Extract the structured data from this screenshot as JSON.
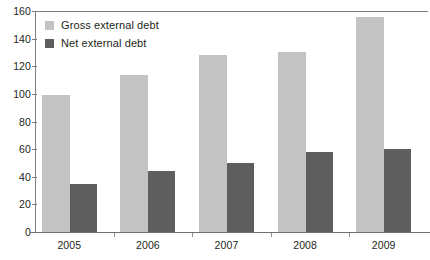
{
  "chart_data": {
    "type": "bar",
    "title": "",
    "subtitle": "",
    "xlabel": "",
    "ylabel": "",
    "categories": [
      "2005",
      "2006",
      "2007",
      "2008",
      "2009"
    ],
    "series": [
      {
        "name": "Gross external debt",
        "color": "#c3c3c3",
        "values": [
          99,
          114,
          128,
          130,
          156
        ]
      },
      {
        "name": "Net external debt",
        "color": "#5e5e5e",
        "values": [
          35,
          44,
          50,
          58,
          60
        ]
      }
    ],
    "ylim": [
      0,
      160
    ],
    "yticks": [
      0,
      20,
      40,
      60,
      80,
      100,
      120,
      140,
      160
    ],
    "ytick_labels": [
      "0",
      "20",
      "40",
      "60",
      "80",
      "100",
      "120",
      "140",
      "160"
    ],
    "grid": false,
    "legend_position": "top-left",
    "annotations": []
  },
  "legend": {
    "items": [
      {
        "label": "Gross external debt",
        "color": "#c3c3c3"
      },
      {
        "label": "Net external debt",
        "color": "#5e5e5e"
      }
    ]
  },
  "axes": {
    "axis_color": "#7d7d7d",
    "baseline_color": "#6f6f6f",
    "text_color": "#231f20"
  }
}
